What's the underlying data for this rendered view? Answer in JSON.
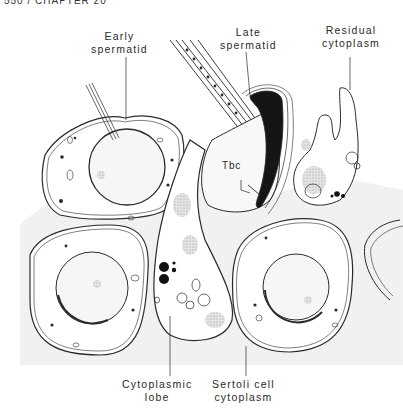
{
  "header": {
    "text": "550 / CHAPTER 20"
  },
  "figure": {
    "labels": {
      "early_spermatid": {
        "line1": "Early",
        "line2": "spermatid"
      },
      "late_spermatid": {
        "line1": "Late",
        "line2": "spermatid"
      },
      "residual_cytoplasm": {
        "line1": "Residual",
        "line2": "cytoplasm"
      },
      "tbc": {
        "text": "Tbc"
      },
      "cytoplasmic_lobe": {
        "line1": "Cytoplasmic",
        "line2": "lobe"
      },
      "sertoli_cytoplasm": {
        "line1": "Sertoli cell",
        "line2": "cytoplasm"
      }
    },
    "colors": {
      "ink": "#2a2a2a",
      "stipple": "#eeeeee",
      "background": "#ffffff"
    }
  }
}
